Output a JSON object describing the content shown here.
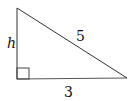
{
  "diagram": {
    "type": "right-triangle",
    "labels": {
      "height": "h",
      "hypotenuse": "5",
      "base": "3"
    },
    "right_angle_marker": true,
    "colors": {
      "stroke": "#333333",
      "text": "#111111",
      "background": "#ffffff"
    }
  }
}
